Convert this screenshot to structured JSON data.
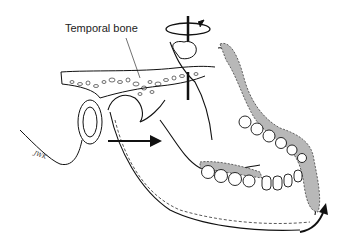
{
  "figure": {
    "labels": {
      "temporal_bone": "Temporal bone"
    },
    "signature": "JWK"
  },
  "colors": {
    "line": "#111111",
    "shade": "#b8b8b8",
    "background": "#ffffff"
  }
}
